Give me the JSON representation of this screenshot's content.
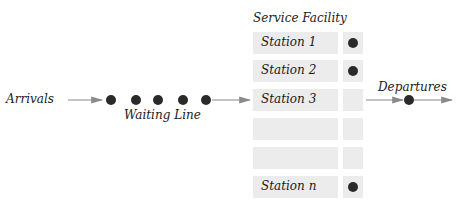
{
  "diagram": {
    "title": "Service Facility",
    "arrivals_label": "Arrivals",
    "waiting_line_label": "Waiting Line",
    "departures_label": "Departures",
    "queue_dots": 5,
    "stations": [
      {
        "label": "Station 1",
        "busy": true
      },
      {
        "label": "Station 2",
        "busy": true
      },
      {
        "label": "Station 3",
        "busy": false
      },
      {
        "label": "",
        "busy": false
      },
      {
        "label": "",
        "busy": false
      },
      {
        "label": "Station n",
        "busy": true
      }
    ],
    "colors": {
      "box": "#ececec",
      "dot": "#2a2a2a",
      "arrow": "#8a8a8a"
    }
  }
}
